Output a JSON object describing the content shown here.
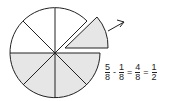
{
  "diagram": {
    "type": "fraction-circle",
    "total_slices": 8,
    "shaded_slices": 5,
    "removed_slices": 1,
    "fill_color": "#e6e6e6",
    "stroke_color": "#222222",
    "background": "#ffffff"
  },
  "equation": {
    "terms": [
      {
        "num": "5",
        "den": "8"
      },
      {
        "num": "1",
        "den": "8"
      },
      {
        "num": "4",
        "den": "8"
      },
      {
        "num": "1",
        "den": "2"
      }
    ],
    "operators": [
      "-",
      "=",
      "="
    ]
  }
}
